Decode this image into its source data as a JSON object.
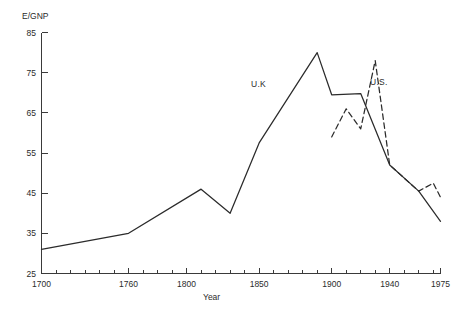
{
  "chart_data": {
    "type": "line",
    "title": "",
    "xlabel": "Year",
    "ylabel": "E/GNP",
    "xlim": [
      1700,
      1975
    ],
    "ylim": [
      25,
      85
    ],
    "grid": false,
    "legend_position": "inline-annotation",
    "yticks": [
      25,
      35,
      45,
      55,
      65,
      75,
      85
    ],
    "ytick_labels": [
      "25",
      "35",
      "45",
      "55",
      "65",
      "75",
      "85"
    ],
    "xticks": [
      1700,
      1760,
      1800,
      1850,
      1900,
      1940,
      1975
    ],
    "xtick_labels": [
      "1700",
      "1760",
      "1800",
      "1850",
      "1900",
      "1940",
      "1975"
    ],
    "xminor_interval": 10,
    "series": [
      {
        "name": "U.K.",
        "style": "solid",
        "annotation": "U.K",
        "x": [
          1700,
          1760,
          1810,
          1830,
          1850,
          1890,
          1900,
          1920,
          1940,
          1960,
          1975
        ],
        "values": [
          31.0,
          35.0,
          46.0,
          40.0,
          57.5,
          80.0,
          69.5,
          69.8,
          52.0,
          45.5,
          38.0
        ]
      },
      {
        "name": "U.S.",
        "style": "dashed",
        "annotation": "U.S.",
        "x": [
          1900,
          1910,
          1920,
          1930,
          1940,
          1960,
          1970,
          1975
        ],
        "values": [
          59.0,
          66.0,
          61.0,
          78.0,
          52.0,
          45.5,
          47.5,
          44.0
        ]
      }
    ]
  },
  "annotations": {
    "uk_label": "U.K",
    "us_label": "U.S."
  },
  "axes": {
    "y_title": "E/GNP",
    "x_title": "Year"
  }
}
